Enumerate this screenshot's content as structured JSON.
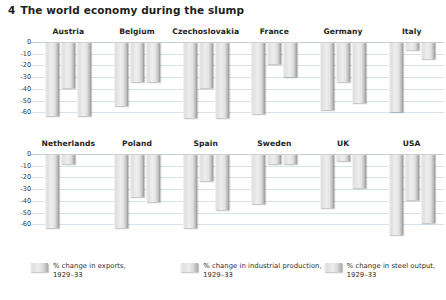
{
  "title": {
    "number": "4",
    "text": "The world economy during the slump"
  },
  "axis": {
    "ticks": [
      "0",
      "-10",
      "-20",
      "-30",
      "-40",
      "-50",
      "-60"
    ]
  },
  "legend": [
    {
      "label_line1": "% change in exports,",
      "label_line2": "1929–33",
      "swatch": "bar-swatch-exports"
    },
    {
      "label_line1": "% change in industrial production,",
      "label_line2": "1929–33",
      "swatch": "bar-swatch-industrial"
    },
    {
      "label_line1": "% change in steel output,",
      "label_line2": "1929–33",
      "swatch": "bar-swatch-steel"
    }
  ],
  "chart_data": {
    "type": "bar",
    "title": "4 The world economy during the slump",
    "xlabel": "",
    "ylabel": "% change, 1929–33",
    "ylim": [
      -70,
      0
    ],
    "yticks": [
      0,
      -10,
      -20,
      -30,
      -40,
      -50,
      -60
    ],
    "grid": true,
    "legend_position": "bottom",
    "categories": [
      "Austria",
      "Belgium",
      "Czechoslovakia",
      "France",
      "Germany",
      "Italy",
      "Netherlands",
      "Poland",
      "Spain",
      "Sweden",
      "UK",
      "USA"
    ],
    "series": [
      {
        "name": "% change in exports, 1929–33",
        "values": [
          -62,
          -54,
          -64,
          -61,
          -57,
          -59,
          -62,
          -62,
          -62,
          -42,
          -45,
          -68
        ]
      },
      {
        "name": "% change in industrial production, 1929–33",
        "values": [
          -38,
          -33,
          -38,
          -18,
          -33,
          -6,
          -8,
          -36,
          -22,
          -8,
          -5,
          -38
        ]
      },
      {
        "name": "% change in steel output, 1929–33",
        "values": [
          -62,
          -33,
          -64,
          -29,
          -51,
          -14,
          null,
          -40,
          -47,
          -8,
          -28,
          -58
        ]
      }
    ],
    "panels": [
      {
        "name": "Austria",
        "row": 1,
        "bars": [
          -62,
          -38,
          -62
        ]
      },
      {
        "name": "Belgium",
        "row": 1,
        "bars": [
          -54,
          -33,
          -33
        ]
      },
      {
        "name": "Czechoslovakia",
        "row": 1,
        "bars": [
          -64,
          -38,
          -64
        ]
      },
      {
        "name": "France",
        "row": 1,
        "bars": [
          -61,
          -18,
          -29
        ]
      },
      {
        "name": "Germany",
        "row": 1,
        "bars": [
          -57,
          -33,
          -51
        ]
      },
      {
        "name": "Italy",
        "row": 1,
        "bars": [
          -59,
          -6,
          -14
        ]
      },
      {
        "name": "Netherlands",
        "row": 2,
        "bars": [
          -62,
          -8,
          null
        ]
      },
      {
        "name": "Poland",
        "row": 2,
        "bars": [
          -62,
          -36,
          -40
        ]
      },
      {
        "name": "Spain",
        "row": 2,
        "bars": [
          -62,
          -22,
          -47
        ]
      },
      {
        "name": "Sweden",
        "row": 2,
        "bars": [
          -42,
          -8,
          -8
        ]
      },
      {
        "name": "UK",
        "row": 2,
        "bars": [
          -45,
          -5,
          -28
        ]
      },
      {
        "name": "USA",
        "row": 2,
        "bars": [
          -68,
          -38,
          -58
        ]
      }
    ]
  }
}
